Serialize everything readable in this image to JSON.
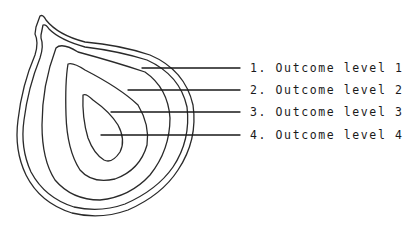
{
  "diagram": {
    "type": "onion-layers",
    "stroke_color": "#2a2a2a",
    "background_color": "#ffffff",
    "labels": [
      {
        "number": "1.",
        "text": "Outcome level 1"
      },
      {
        "number": "2.",
        "text": "Outcome level 2"
      },
      {
        "number": "3.",
        "text": "Outcome level 3"
      },
      {
        "number": "4.",
        "text": "Outcome level 4"
      }
    ]
  }
}
